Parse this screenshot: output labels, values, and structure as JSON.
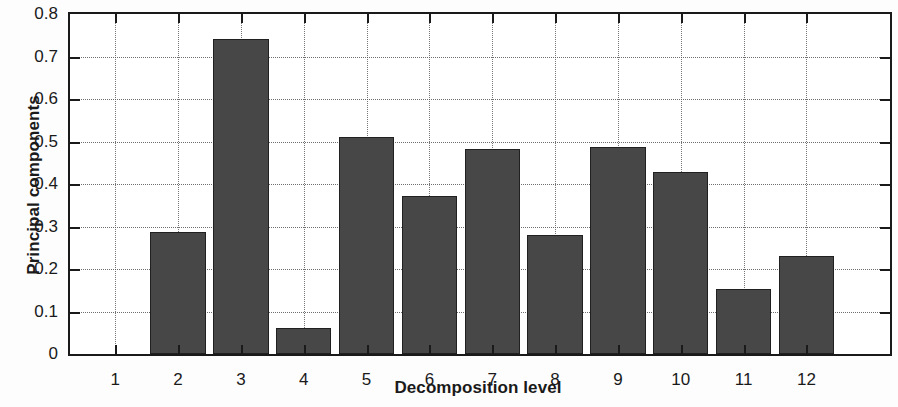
{
  "chart_data": {
    "type": "bar",
    "title": "",
    "xlabel": "Decomposition level",
    "ylabel": "Principal components",
    "categories": [
      "1",
      "2",
      "3",
      "4",
      "5",
      "6",
      "7",
      "8",
      "9",
      "10",
      "11",
      "12"
    ],
    "values": [
      0,
      0.287,
      0.742,
      0.062,
      0.51,
      0.372,
      0.483,
      0.28,
      0.488,
      0.428,
      0.153,
      0.23
    ],
    "ylim": [
      0,
      0.8
    ],
    "ytick_labels": [
      "0",
      "0.1",
      "0.2",
      "0.3",
      "0.4",
      "0.5",
      "0.6",
      "0.7",
      "0.8"
    ],
    "ytick_values": [
      0,
      0.1,
      0.2,
      0.3,
      0.4,
      0.5,
      0.6,
      0.7,
      0.8
    ],
    "grid": true,
    "legend": "none",
    "bar_color": "#474747",
    "bar_edge_color": "#202020",
    "axis_color": "#1a1a1a",
    "background_color": "#ffffff"
  }
}
